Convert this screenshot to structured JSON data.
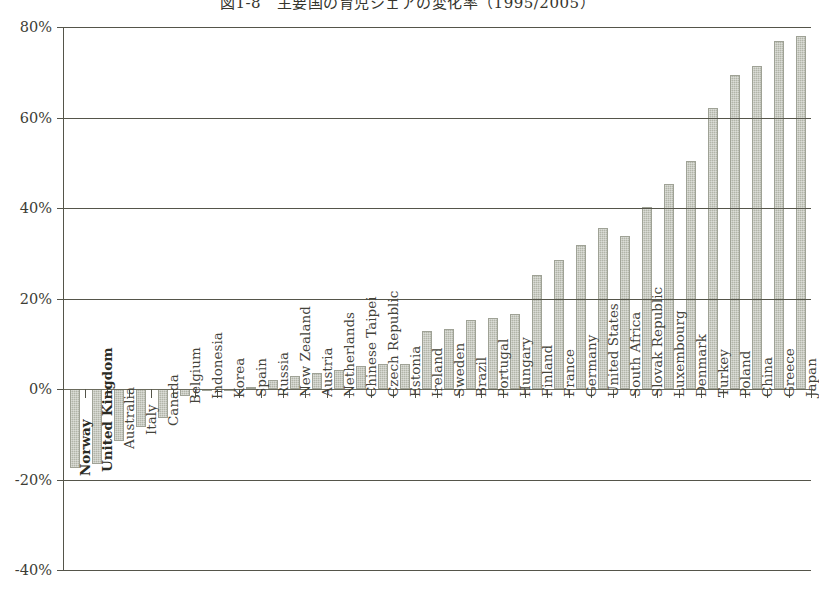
{
  "chart_data": {
    "type": "bar",
    "title": "図1-8　主要国の育児シェアの変化率（1995/2005）",
    "xlabel": "",
    "ylabel": "",
    "ylim": [
      -40,
      80
    ],
    "yticks": [
      "80%",
      "60%",
      "40%",
      "20%",
      "0%",
      "-20%",
      "-40%"
    ],
    "ytick_values": [
      80,
      60,
      40,
      20,
      0,
      -20,
      -40
    ],
    "grid": true,
    "legend": "none",
    "bar_color": "#b2b5a9",
    "axis_color": "#55554a",
    "highlighted_categories": [
      "Norway",
      "United Kingdom"
    ],
    "categories": [
      "Norway",
      "United Kingdom",
      "Australia",
      "Italy",
      "Canada",
      "Belgium",
      "Indonesia",
      "Korea",
      "Spain",
      "Russia",
      "New Zealand",
      "Austria",
      "Netherlands",
      "Chinese Taipei",
      "Czech Republic",
      "Estonia",
      "Ireland",
      "Sweden",
      "Brazil",
      "Portugal",
      "Hungary",
      "Finland",
      "France",
      "Germany",
      "United States",
      "South Africa",
      "Slovak Republic",
      "Luxembourg",
      "Denmark",
      "Turkey",
      "Poland",
      "China",
      "Greece",
      "Japan"
    ],
    "values": [
      -17.5,
      -16.5,
      -11.5,
      -8.5,
      -6.5,
      -1.5,
      -0.5,
      -0.3,
      0.5,
      2.0,
      2.8,
      3.5,
      4.3,
      5.0,
      5.5,
      5.6,
      12.8,
      13.2,
      15.3,
      15.8,
      16.5,
      25.2,
      28.5,
      31.8,
      35.5,
      33.8,
      40.3,
      45.2,
      50.3,
      62.0,
      69.5,
      71.3,
      77.0,
      78.0
    ]
  }
}
